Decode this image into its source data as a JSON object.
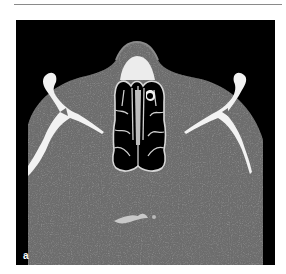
{
  "figure": {
    "panel_label": "a",
    "colors": {
      "background": "#000000",
      "soft_tissue": "#6e6e6e",
      "bone": "#f2f2f2",
      "air": "#000000",
      "page": "#ffffff",
      "rule": "#8a8a8a"
    }
  }
}
